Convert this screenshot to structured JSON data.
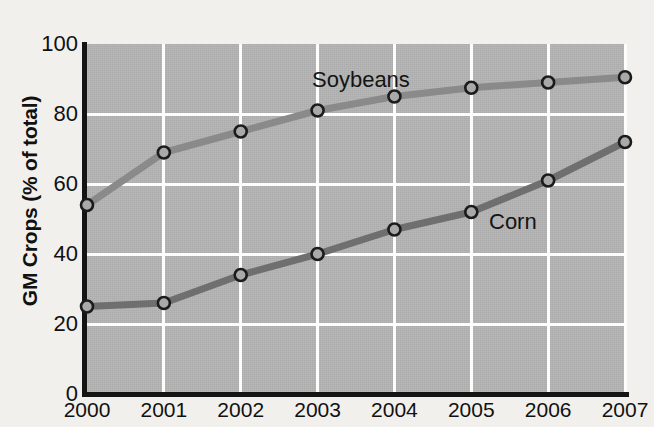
{
  "chart_data": {
    "type": "line",
    "title": "",
    "xlabel": "",
    "ylabel": "GM Crops (% of total)",
    "categories": [
      "2000",
      "2001",
      "2002",
      "2003",
      "2004",
      "2005",
      "2006",
      "2007"
    ],
    "x": [
      2000,
      2001,
      2002,
      2003,
      2004,
      2005,
      2006,
      2007
    ],
    "xlim": [
      2000,
      2007
    ],
    "ylim": [
      0,
      100
    ],
    "yticks": [
      0,
      20,
      40,
      60,
      80,
      100
    ],
    "ytick_labels": [
      "0",
      "20",
      "40",
      "60",
      "80",
      "100"
    ],
    "xtick_labels": [
      "2000",
      "2001",
      "2002",
      "2003",
      "2004",
      "2005",
      "2006",
      "2007"
    ],
    "grid": true,
    "grid_color": "#fdfdfb",
    "plot_background": "#b2b2b2",
    "figure_background": "#f1f0ec",
    "legend_position": "inline-annotation",
    "series": [
      {
        "name": "Soybeans",
        "values": [
          54,
          69,
          75,
          81,
          85,
          87.5,
          89,
          90.5
        ],
        "line_color": "#8a8a8a",
        "marker": "open-circle",
        "marker_edge_color": "#1b1b1b",
        "label_position": {
          "x": 312,
          "y": 69
        }
      },
      {
        "name": "Corn",
        "values": [
          25,
          26,
          34,
          40,
          47,
          52,
          61,
          72
        ],
        "line_color": "#6f6f6f",
        "marker": "open-circle",
        "marker_edge_color": "#1b1b1b",
        "label_position": {
          "x": 489,
          "y": 211
        }
      }
    ],
    "annotations": [
      {
        "text": "Soybeans",
        "x": 312,
        "y": 69
      },
      {
        "text": "Corn",
        "x": 489,
        "y": 211
      }
    ]
  },
  "axes": {
    "y_title": "GM Crops (% of total)",
    "y_labels": [
      "100",
      "80",
      "60",
      "40",
      "20",
      "0"
    ],
    "x_labels": [
      "2000",
      "2001",
      "2002",
      "2003",
      "2004",
      "2005",
      "2006",
      "2007"
    ]
  },
  "series_labels": {
    "soybeans": "Soybeans",
    "corn": "Corn"
  }
}
